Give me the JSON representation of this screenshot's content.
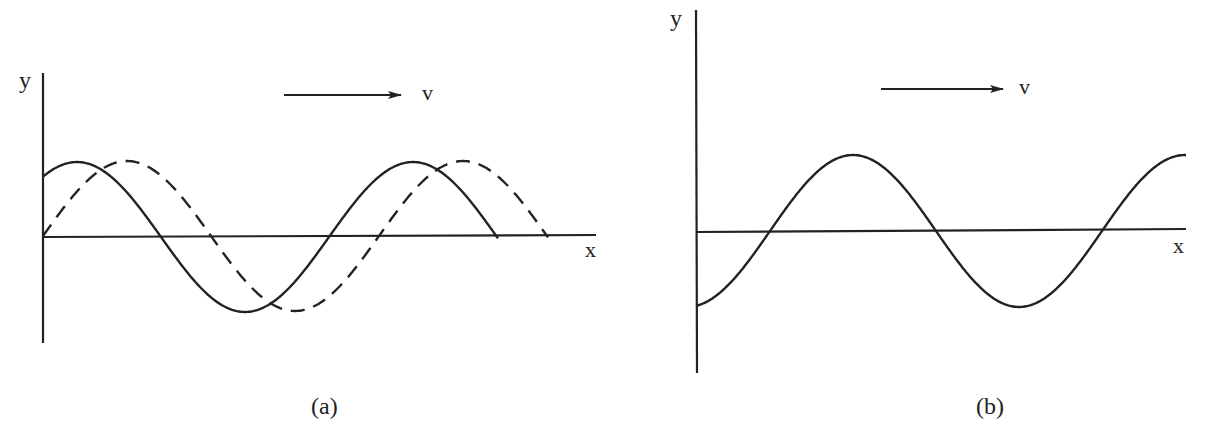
{
  "figure": {
    "panels": [
      {
        "id": "a",
        "caption": "(a)",
        "y_axis_label": "y",
        "x_axis_label": "x",
        "velocity_label": "v",
        "description": "Traveling sine wave at two instants: solid (earlier) and dashed (later, shifted in +x direction by v)"
      },
      {
        "id": "b",
        "caption": "(b)",
        "y_axis_label": "y",
        "x_axis_label": "x",
        "velocity_label": "v",
        "description": "Single sinusoidal wave with negative initial displacement moving in +x direction"
      }
    ],
    "colors": {
      "ink": "#222222",
      "background": "#ffffff"
    }
  },
  "chart_data": [
    {
      "type": "line",
      "title": "(a)",
      "xlabel": "x",
      "ylabel": "y",
      "annotation": "arrow → v (wave velocity, +x direction)",
      "grid": false,
      "series": [
        {
          "name": "solid (t1)",
          "style": "solid",
          "function": "y = A·sin(2π(x0 − x)/λ) with phase such that y(0)≈0.87A",
          "amplitude": 1,
          "wavelength_units": 1,
          "x_range": [
            0,
            1.35
          ]
        },
        {
          "name": "dashed (t2)",
          "style": "dashed",
          "function": "y = A·sin(2πx/λ)",
          "amplitude": 1,
          "wavelength_units": 1,
          "x_range": [
            0,
            1.5
          ]
        }
      ]
    },
    {
      "type": "line",
      "title": "(b)",
      "xlabel": "x",
      "ylabel": "y",
      "annotation": "arrow → v (wave velocity, +x direction)",
      "grid": false,
      "series": [
        {
          "name": "wave",
          "style": "solid",
          "function": "y = A·sin(2π(x − x0)/λ), y(0)≈−A",
          "amplitude": 1,
          "wavelength_units": 1,
          "x_range": [
            0,
            1.5
          ]
        }
      ]
    }
  ]
}
